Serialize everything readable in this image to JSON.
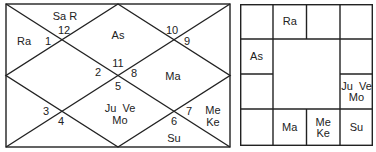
{
  "north_chart": {
    "houses": [
      {
        "num": "1",
        "planets": "Ra"
      },
      {
        "num": "2",
        "planets": ""
      },
      {
        "num": "3",
        "planets": ""
      },
      {
        "num": "4",
        "planets": ""
      },
      {
        "num": "5",
        "planets": "Ju  Ve\nMo"
      },
      {
        "num": "6",
        "planets": "Su"
      },
      {
        "num": "7",
        "planets": "Me\nKe"
      },
      {
        "num": "8",
        "planets": "Ma"
      },
      {
        "num": "9",
        "planets": ""
      },
      {
        "num": "10",
        "planets": ""
      },
      {
        "num": "11",
        "planets": "As"
      },
      {
        "num": "12",
        "planets": "Sa R"
      }
    ]
  },
  "south_chart": {
    "cells": [
      {
        "row": 0,
        "col": 0,
        "text": ""
      },
      {
        "row": 0,
        "col": 1,
        "text": "Ra"
      },
      {
        "row": 0,
        "col": 2,
        "text": ""
      },
      {
        "row": 0,
        "col": 3,
        "text": ""
      },
      {
        "row": 1,
        "col": 0,
        "text": "As"
      },
      {
        "row": 1,
        "col": 3,
        "text": ""
      },
      {
        "row": 2,
        "col": 0,
        "text": ""
      },
      {
        "row": 2,
        "col": 3,
        "text": "Ju  Ve\nMo"
      },
      {
        "row": 3,
        "col": 0,
        "text": ""
      },
      {
        "row": 3,
        "col": 1,
        "text": "Ma"
      },
      {
        "row": 3,
        "col": 2,
        "text": "Me\nKe"
      },
      {
        "row": 3,
        "col": 3,
        "text": "Su"
      }
    ]
  },
  "colors": {
    "line": "#222222",
    "text": "#222222",
    "background": "#ffffff"
  }
}
